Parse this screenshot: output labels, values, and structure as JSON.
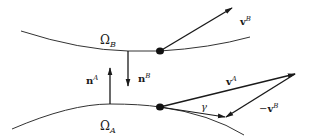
{
  "diagram": {
    "colors": {
      "line": "#2a2a2a",
      "background": "#ffffff"
    },
    "regions": [
      {
        "id": "omega-b",
        "symbol": "Ω",
        "subscript": "B"
      },
      {
        "id": "omega-a",
        "symbol": "Ω",
        "subscript": "A"
      }
    ],
    "vectors": [
      {
        "id": "v-b",
        "base": "v",
        "superscript": "B",
        "prefix": ""
      },
      {
        "id": "n-b",
        "base": "n",
        "superscript": "B",
        "prefix": ""
      },
      {
        "id": "n-a",
        "base": "n",
        "superscript": "A",
        "prefix": ""
      },
      {
        "id": "v-a",
        "base": "v",
        "superscript": "A",
        "prefix": ""
      },
      {
        "id": "neg-v-b",
        "base": "v",
        "superscript": "B",
        "prefix": "−"
      }
    ],
    "angle": {
      "symbol": "γ"
    }
  }
}
